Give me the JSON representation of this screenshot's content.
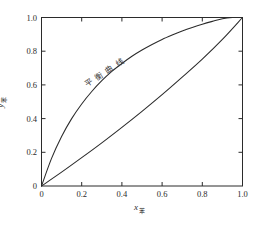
{
  "figure": {
    "background_color": "#ffffff",
    "line_color": "#2b2b2b",
    "axis_color": "#2b2b2b"
  },
  "annotations": {
    "equilibrium_curve_label": "平衡曲线"
  },
  "axes": {
    "x_title_symbol": "x",
    "x_title_subscript": "苯",
    "y_title_symbol": "y",
    "y_title_subscript": "苯"
  },
  "chart_data": {
    "type": "line",
    "title": "",
    "subtitle": "",
    "xlabel": "x苯",
    "ylabel": "y苯",
    "xlim": [
      0,
      1
    ],
    "ylim": [
      0,
      1
    ],
    "grid": false,
    "legend": null,
    "legend_position": "none",
    "xticks": [
      "0",
      "0.2",
      "0.4",
      "0.6",
      "0.8",
      "1.0"
    ],
    "xtick_values": [
      0,
      0.2,
      0.4,
      0.6,
      0.8,
      1.0
    ],
    "yticks": [
      "0",
      "0.2",
      "0.4",
      "0.6",
      "0.8",
      "1.0"
    ],
    "ytick_values": [
      0,
      0.2,
      0.4,
      0.6,
      0.8,
      1.0
    ],
    "annotations": [
      {
        "text": "平衡曲线",
        "x": 0.3,
        "y": 0.6,
        "rotation": -34
      }
    ],
    "series": [
      {
        "name": "平衡曲线",
        "type": "line",
        "x": [
          0,
          0.05,
          0.1,
          0.15,
          0.2,
          0.25,
          0.3,
          0.35,
          0.4,
          0.45,
          0.5,
          0.55,
          0.6,
          0.65,
          0.7,
          0.75,
          0.8,
          0.85,
          0.9,
          0.95,
          1.0
        ],
        "values": [
          0,
          0.164,
          0.294,
          0.4,
          0.487,
          0.561,
          0.625,
          0.68,
          0.727,
          0.77,
          0.807,
          0.84,
          0.87,
          0.896,
          0.92,
          0.941,
          0.96,
          0.977,
          0.993,
          1.0,
          1.0
        ]
      },
      {
        "name": "对角线",
        "type": "line",
        "x": [
          0,
          0.1,
          0.2,
          0.3,
          0.4,
          0.5,
          0.6,
          0.7,
          0.8,
          0.9,
          1.0
        ],
        "values": [
          0,
          0.082,
          0.168,
          0.256,
          0.348,
          0.443,
          0.542,
          0.646,
          0.753,
          0.87,
          1.0
        ]
      }
    ]
  }
}
